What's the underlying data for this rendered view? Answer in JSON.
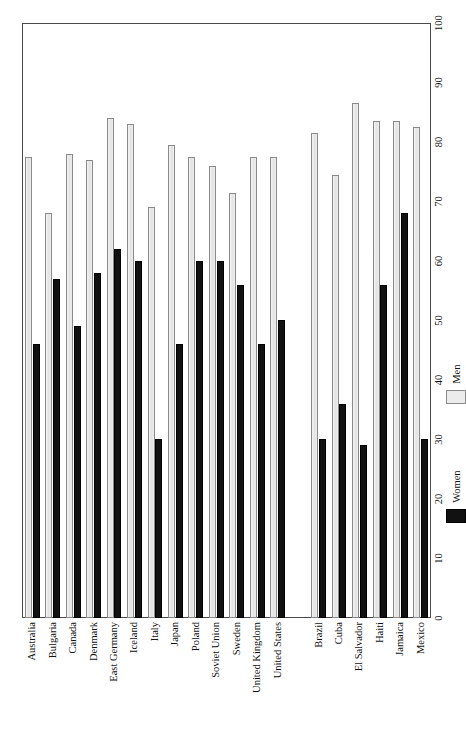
{
  "chart_data": {
    "type": "bar",
    "orientation": "rotated-90",
    "title": "",
    "subtitle": "",
    "xlabel": "",
    "ylabel": "",
    "ylim": [
      0,
      100
    ],
    "axis_ticks": [
      0,
      10,
      20,
      30,
      40,
      50,
      60,
      70,
      80,
      90,
      100
    ],
    "tick_step": 10,
    "grid": false,
    "legend_position": "below-axis",
    "categories": [
      "Australia",
      "Bulgaria",
      "Canada",
      "Denmark",
      "East Germany",
      "Iceland",
      "Italy",
      "Japan",
      "Poland",
      "Soviet Union",
      "Sweden",
      "United Kingdom",
      "United States",
      "Brazil",
      "Cuba",
      "El Salvador",
      "Haiti",
      "Jamaica",
      "Mexico"
    ],
    "group_breaks": [
      13
    ],
    "series": [
      {
        "name": "Women",
        "color": "#111111",
        "values": [
          46,
          57,
          49,
          58,
          62,
          60,
          30,
          46,
          60,
          60,
          56,
          46,
          50,
          30,
          36,
          29,
          56,
          68,
          30
        ]
      },
      {
        "name": "Men",
        "color": "#ececec",
        "values": [
          77.5,
          68,
          78,
          77,
          84,
          83,
          69,
          79.5,
          77.5,
          76,
          71.5,
          77.5,
          77.5,
          81.5,
          74.5,
          86.5,
          83.5,
          83.5,
          82.5
        ]
      }
    ]
  },
  "legend": {
    "items": [
      {
        "label": "Women",
        "color": "#111111"
      },
      {
        "label": "Men",
        "color": "#ececec"
      }
    ]
  },
  "axis": {
    "labels": [
      "0",
      "10",
      "20",
      "30",
      "40",
      "50",
      "60",
      "70",
      "80",
      "90",
      "100"
    ]
  }
}
